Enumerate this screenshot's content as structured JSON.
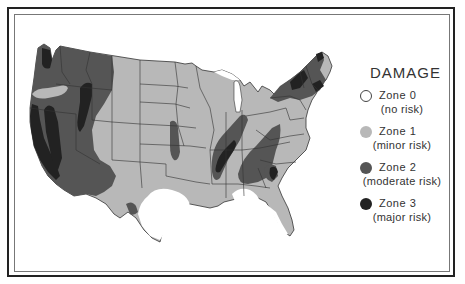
{
  "map": {
    "subject": "United States earthquake damage risk zones",
    "colors": {
      "zone0": "#ffffff",
      "zone1": "#b8b8b8",
      "zone2": "#555555",
      "zone3": "#222222",
      "borders": "#333333"
    }
  },
  "legend": {
    "title": "DAMAGE",
    "items": [
      {
        "zone": "Zone 0",
        "description": "(no risk)",
        "color": "#ffffff"
      },
      {
        "zone": "Zone 1",
        "description": "(minor risk)",
        "color": "#b8b8b8"
      },
      {
        "zone": "Zone 2",
        "description": "(moderate risk)",
        "color": "#555555"
      },
      {
        "zone": "Zone 3",
        "description": "(major risk)",
        "color": "#222222"
      }
    ]
  }
}
